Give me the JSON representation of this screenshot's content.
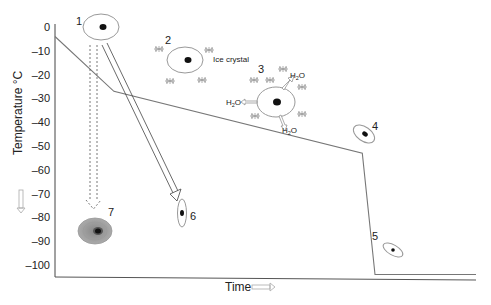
{
  "diagram": {
    "y_axis": {
      "label": "Temperature °C",
      "ticks": [
        "0",
        "–10",
        "–20",
        "–30",
        "–40",
        "–50",
        "–60",
        "–70",
        "–80",
        "–90",
        "–100"
      ],
      "range": [
        0,
        -100
      ]
    },
    "x_axis": {
      "label": "Time"
    },
    "cooling_curve": [
      {
        "t": 0.0,
        "temp": -4
      },
      {
        "t": 0.14,
        "temp": -27
      },
      {
        "t": 0.73,
        "temp": -53
      },
      {
        "t": 0.76,
        "temp": -104
      },
      {
        "t": 1.0,
        "temp": -104
      }
    ],
    "cells": [
      {
        "id": "1",
        "label": "1",
        "state": "initial cell"
      },
      {
        "id": "2",
        "label": "2",
        "state": "cell with extracellular ice crystals",
        "annotation": "Ice crystal"
      },
      {
        "id": "3",
        "label": "3",
        "state": "cell losing water",
        "water_labels": [
          "H2O",
          "H2O",
          "H2O"
        ]
      },
      {
        "id": "4",
        "label": "4",
        "state": "dehydrated cell"
      },
      {
        "id": "5",
        "label": "5",
        "state": "shrunken cell"
      },
      {
        "id": "6",
        "label": "6",
        "state": "shrunken cell after fast cooling"
      },
      {
        "id": "7",
        "label": "7",
        "state": "cell with intracellular ice"
      }
    ],
    "water_text": "H",
    "water_sub": "2",
    "water_suffix": "O"
  }
}
